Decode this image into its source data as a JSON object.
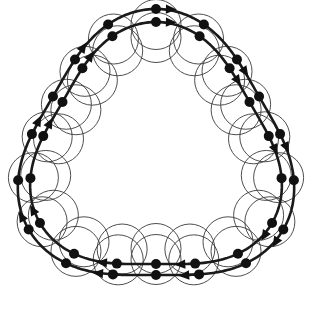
{
  "figure": {
    "type": "geometric-diagram",
    "background_color": "#ffffff",
    "curve_color": "#1a1a1a",
    "circle_color": "#3a3a3a",
    "vertex_color": "#111111",
    "symmetry": "3-fold",
    "canvas": {
      "width": 312,
      "height": 311
    },
    "center": {
      "x": 156,
      "y": 156
    }
  },
  "chart_data": {
    "type": "scatter",
    "xlabel": "",
    "ylabel": "",
    "grid": false,
    "legend": "none",
    "xlim": [
      0,
      312
    ],
    "ylim": [
      0,
      311
    ],
    "curves": [
      {
        "name": "outer-curve",
        "rotation_deg": 0,
        "radius_mean": 133,
        "radius_modulation": 14,
        "lobes": 3,
        "stroke_width": 2.6,
        "vertex_count": 18
      },
      {
        "name": "inner-curve",
        "rotation_deg": 40,
        "radius_mean": 121,
        "radius_modulation": 13,
        "lobes": 3,
        "stroke_width": 2.6,
        "vertex_count": 18
      }
    ],
    "circles": {
      "radius": 25,
      "count": 36,
      "stroke_width": 0.9,
      "fill": "none"
    },
    "arrowheads": {
      "count": 18,
      "shape": "solid-triangle",
      "size": 9
    },
    "vertices": {
      "marker": "filled-circle",
      "radius": 5,
      "total": 36
    }
  }
}
